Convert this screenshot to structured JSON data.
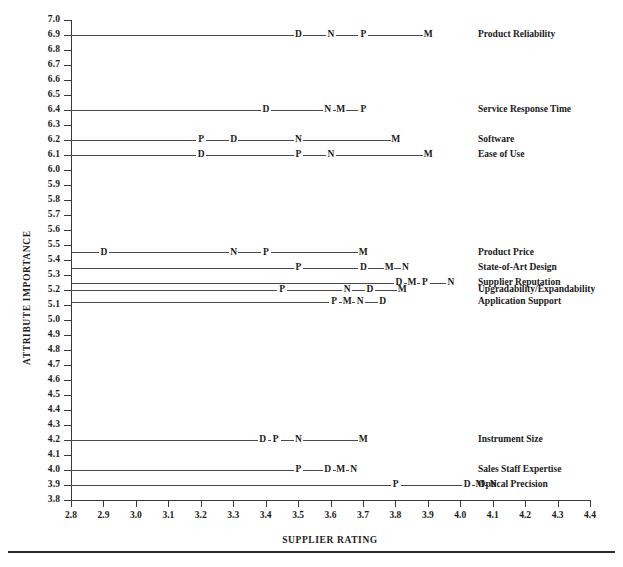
{
  "chart_data": {
    "type": "scatter",
    "title": "",
    "xlabel": "SUPPLIER RATING",
    "ylabel": "ATTRIBUTE IMPORTANCE",
    "xlim": [
      2.8,
      4.4
    ],
    "ylim": [
      3.8,
      7.0
    ],
    "xticks": [
      "2.8",
      "2.9",
      "3.0",
      "3.1",
      "3.2",
      "3.3",
      "3.4",
      "3.5",
      "3.6",
      "3.7",
      "3.8",
      "3.9",
      "4.0",
      "4.1",
      "4.2",
      "4.3",
      "4.4"
    ],
    "yticks": [
      "7.0",
      "6.9",
      "6.8",
      "6.7",
      "6.6",
      "6.5",
      "6.4",
      "6.3",
      "6.2",
      "6.1",
      "6.0",
      "5.9",
      "5.8",
      "5.7",
      "5.6",
      "5.5",
      "5.4",
      "5.3",
      "5.2",
      "5.1",
      "5.0",
      "4.9",
      "4.8",
      "4.7",
      "4.6",
      "4.5",
      "4.4",
      "4.3",
      "4.2",
      "4.1",
      "4.0",
      "3.9",
      "3.8"
    ],
    "grid": false,
    "legend": "none",
    "series_keys": [
      "D",
      "N",
      "P",
      "M"
    ],
    "rows": [
      {
        "label": "Product Reliability",
        "importance": 6.9,
        "points": [
          {
            "key": "D",
            "rating": 3.5
          },
          {
            "key": "N",
            "rating": 3.6
          },
          {
            "key": "P",
            "rating": 3.7
          },
          {
            "key": "M",
            "rating": 3.9
          }
        ]
      },
      {
        "label": "Service Response Time",
        "importance": 6.4,
        "points": [
          {
            "key": "D",
            "rating": 3.4
          },
          {
            "key": "N",
            "rating": 3.59
          },
          {
            "key": "M",
            "rating": 3.63
          },
          {
            "key": "P",
            "rating": 3.7
          }
        ]
      },
      {
        "label": "Software",
        "importance": 6.2,
        "points": [
          {
            "key": "P",
            "rating": 3.2
          },
          {
            "key": "D",
            "rating": 3.3
          },
          {
            "key": "N",
            "rating": 3.5
          },
          {
            "key": "M",
            "rating": 3.8
          }
        ]
      },
      {
        "label": "Ease of Use",
        "importance": 6.1,
        "points": [
          {
            "key": "D",
            "rating": 3.2
          },
          {
            "key": "P",
            "rating": 3.5
          },
          {
            "key": "N",
            "rating": 3.6
          },
          {
            "key": "M",
            "rating": 3.9
          }
        ]
      },
      {
        "label": "Product Price",
        "importance": 5.45,
        "points": [
          {
            "key": "D",
            "rating": 2.9
          },
          {
            "key": "N",
            "rating": 3.3
          },
          {
            "key": "P",
            "rating": 3.4
          },
          {
            "key": "M",
            "rating": 3.7
          }
        ]
      },
      {
        "label": "State-of-Art Design",
        "importance": 5.35,
        "points": [
          {
            "key": "P",
            "rating": 3.5
          },
          {
            "key": "D",
            "rating": 3.7
          },
          {
            "key": "M",
            "rating": 3.78
          },
          {
            "key": "N",
            "rating": 3.83
          }
        ]
      },
      {
        "label": "Supplier Reputation",
        "importance": 5.25,
        "points": [
          {
            "key": "D",
            "rating": 3.81
          },
          {
            "key": "M",
            "rating": 3.85
          },
          {
            "key": "P",
            "rating": 3.89
          },
          {
            "key": "N",
            "rating": 3.97
          }
        ]
      },
      {
        "label": "Upgradability/Expandability",
        "importance": 5.2,
        "points": [
          {
            "key": "P",
            "rating": 3.45
          },
          {
            "key": "N",
            "rating": 3.65
          },
          {
            "key": "D",
            "rating": 3.72
          },
          {
            "key": "M",
            "rating": 3.82
          }
        ]
      },
      {
        "label": "Application Support",
        "importance": 5.12,
        "points": [
          {
            "key": "P",
            "rating": 3.61
          },
          {
            "key": "M",
            "rating": 3.65
          },
          {
            "key": "N",
            "rating": 3.69
          },
          {
            "key": "D",
            "rating": 3.76
          }
        ]
      },
      {
        "label": "Instrument Size",
        "importance": 4.2,
        "points": [
          {
            "key": "D",
            "rating": 3.39
          },
          {
            "key": "P",
            "rating": 3.43
          },
          {
            "key": "N",
            "rating": 3.5
          },
          {
            "key": "M",
            "rating": 3.7
          }
        ]
      },
      {
        "label": "Sales Staff Expertise",
        "importance": 4.0,
        "points": [
          {
            "key": "P",
            "rating": 3.5
          },
          {
            "key": "D",
            "rating": 3.59
          },
          {
            "key": "M",
            "rating": 3.63
          },
          {
            "key": "N",
            "rating": 3.67
          }
        ]
      },
      {
        "label": "Optical Precision",
        "importance": 3.9,
        "points": [
          {
            "key": "P",
            "rating": 3.8
          },
          {
            "key": "D",
            "rating": 4.02
          },
          {
            "key": "M",
            "rating": 4.06
          },
          {
            "key": "N",
            "rating": 4.1
          }
        ]
      }
    ]
  },
  "colors": {
    "axis": "#3a3a3a",
    "line": "#4a4a4a",
    "text": "#1a1a1a",
    "background": "#ffffff",
    "rule": "#2b2b2b"
  }
}
